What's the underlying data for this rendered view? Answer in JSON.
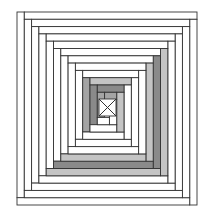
{
  "figure": {
    "outer": {
      "x": 17,
      "y": 12,
      "w": 180,
      "h": 193
    },
    "step": 7.3,
    "rings": 12,
    "colors": {
      "white": "#ffffff",
      "light_grey": "#c4c4c4",
      "mid_grey": "#a4a4a4",
      "dark_grey": "#8a8a8a",
      "line": "#333333"
    },
    "grey_strips": [
      {
        "ring": 4,
        "side": "right",
        "color": "light_grey"
      },
      {
        "ring": 5,
        "side": "right",
        "color": "dark_grey"
      },
      {
        "ring": 6,
        "side": "right",
        "color": "light_grey"
      },
      {
        "ring": 4,
        "side": "bottom",
        "color": "light_grey"
      },
      {
        "ring": 5,
        "side": "bottom",
        "color": "dark_grey"
      },
      {
        "ring": 6,
        "side": "bottom",
        "color": "light_grey"
      },
      {
        "ring": 9,
        "side": "top",
        "color": "light_grey"
      },
      {
        "ring": 9,
        "side": "left",
        "color": "mid_grey"
      },
      {
        "ring": 10,
        "side": "top",
        "color": "dark_grey"
      },
      {
        "ring": 10,
        "side": "left",
        "color": "dark_grey"
      },
      {
        "ring": 10,
        "side": "right",
        "color": "light_grey"
      },
      {
        "ring": 11,
        "side": "top",
        "color": "mid_grey"
      },
      {
        "ring": 11,
        "side": "left",
        "color": "mid_grey"
      }
    ],
    "center_mark": "x-cross"
  }
}
